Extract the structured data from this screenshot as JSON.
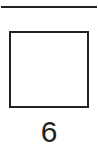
{
  "figure": {
    "top_rule": true,
    "shape": "square",
    "label": "6"
  }
}
